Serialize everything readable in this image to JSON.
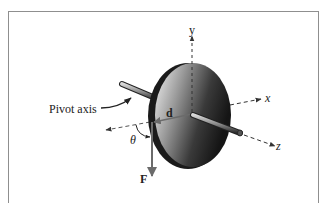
{
  "diagram": {
    "labels": {
      "pivot_axis": "Pivot axis",
      "y_axis": "y",
      "x_axis": "x",
      "z_axis": "z",
      "distance": "d",
      "force": "F",
      "angle": "θ"
    },
    "colors": {
      "frame_border": "#8f8f8f",
      "vector_color": "#6b6b6b",
      "disk_dark": "#1e1e1e",
      "disk_light": "#f2f2f2",
      "axis_dash": "#555555"
    }
  }
}
